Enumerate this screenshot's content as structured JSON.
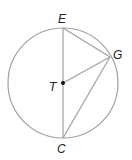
{
  "diagram": {
    "type": "circle-geometry",
    "circle": {
      "center_label": "T",
      "cx": 63,
      "cy": 83,
      "r": 55
    },
    "points": {
      "E": {
        "label": "E",
        "x": 63,
        "y": 28
      },
      "G": {
        "label": "G",
        "x": 110,
        "y": 57
      },
      "C": {
        "label": "C",
        "x": 63,
        "y": 138
      },
      "T": {
        "label": "T",
        "x": 63,
        "y": 83
      }
    },
    "segments": [
      "EC",
      "EG",
      "TG",
      "GC"
    ],
    "colors": {
      "line": "#a0a0a0",
      "text": "#222222",
      "point": "#111111"
    }
  }
}
